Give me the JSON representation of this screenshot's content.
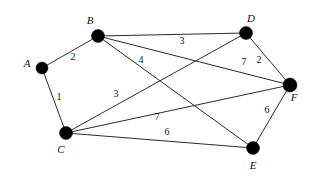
{
  "figure": {
    "type": "weighted-undirected-graph",
    "width": 314,
    "height": 181,
    "background": "#ffffff",
    "ink_color": "#111111",
    "edge_color": "#2b2b2b",
    "node_color": "#000000"
  },
  "nodes": [
    {
      "id": "A",
      "label": "A",
      "x": 42,
      "y": 68,
      "r": 6,
      "label_x": 27,
      "label_y": 63
    },
    {
      "id": "B",
      "label": "B",
      "x": 98,
      "y": 36,
      "r": 6.5,
      "label_x": 90,
      "label_y": 20
    },
    {
      "id": "C",
      "label": "C",
      "x": 66,
      "y": 133,
      "r": 6.5,
      "label_x": 61,
      "label_y": 149
    },
    {
      "id": "D",
      "label": "D",
      "x": 246,
      "y": 33,
      "r": 6.5,
      "label_x": 251,
      "label_y": 18
    },
    {
      "id": "E",
      "label": "E",
      "x": 253,
      "y": 148,
      "r": 6.5,
      "label_x": 253,
      "label_y": 165
    },
    {
      "id": "F",
      "label": "F",
      "x": 290,
      "y": 85,
      "r": 7,
      "label_x": 294,
      "label_y": 97
    }
  ],
  "edges": [
    {
      "id": "A-B",
      "from": "A",
      "to": "B",
      "weight": "2",
      "label_x": 73,
      "label_y": 57
    },
    {
      "id": "A-C",
      "from": "A",
      "to": "C",
      "weight": "1",
      "label_x": 59,
      "label_y": 97
    },
    {
      "id": "B-D",
      "from": "B",
      "to": "D",
      "weight": "3",
      "label_x": 182,
      "label_y": 41
    },
    {
      "id": "B-E",
      "from": "B",
      "to": "E",
      "weight": "4",
      "label_x": 141,
      "label_y": 60
    },
    {
      "id": "B-F",
      "from": "B",
      "to": "F",
      "weight": "7",
      "label_x": 244,
      "label_y": 62
    },
    {
      "id": "C-D",
      "from": "C",
      "to": "D",
      "weight": "3",
      "label_x": 116,
      "label_y": 94
    },
    {
      "id": "C-F",
      "from": "C",
      "to": "F",
      "weight": "7",
      "label_x": 157,
      "label_y": 117
    },
    {
      "id": "C-E",
      "from": "C",
      "to": "E",
      "weight": "6",
      "label_x": 167,
      "label_y": 132
    },
    {
      "id": "D-F",
      "from": "D",
      "to": "F",
      "weight": "2",
      "label_x": 259,
      "label_y": 60
    },
    {
      "id": "E-F",
      "from": "E",
      "to": "F",
      "weight": "6",
      "label_x": 267,
      "label_y": 110
    }
  ],
  "chart_data": {
    "type": "graph",
    "title": "",
    "vertices": [
      "A",
      "B",
      "C",
      "D",
      "E",
      "F"
    ],
    "edge_list": [
      [
        "A",
        "B",
        2
      ],
      [
        "A",
        "C",
        1
      ],
      [
        "B",
        "D",
        3
      ],
      [
        "B",
        "E",
        4
      ],
      [
        "B",
        "F",
        7
      ],
      [
        "C",
        "D",
        3
      ],
      [
        "C",
        "F",
        7
      ],
      [
        "C",
        "E",
        6
      ],
      [
        "D",
        "F",
        2
      ],
      [
        "E",
        "F",
        6
      ]
    ],
    "directed": false,
    "weighted": true,
    "edge_count": 10,
    "vertex_count": 6
  }
}
